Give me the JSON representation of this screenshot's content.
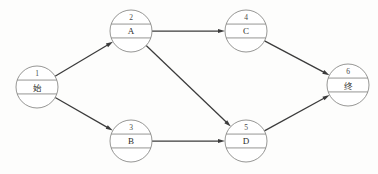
{
  "diagram": {
    "type": "directed-graph",
    "canvas": {
      "width": 378,
      "height": 174,
      "background": "#fdfdfc"
    },
    "style": {
      "node_stroke": "#8a8a88",
      "node_fill": "#ffffff",
      "edge_stroke": "#3b3b3b",
      "text_color": "#2e2e2c"
    },
    "nodes": [
      {
        "id": "1",
        "label": "始",
        "cjk": true,
        "cx": 37,
        "cy": 87,
        "r": 21
      },
      {
        "id": "2",
        "label": "A",
        "cjk": false,
        "cx": 131,
        "cy": 31,
        "r": 21
      },
      {
        "id": "3",
        "label": "B",
        "cjk": false,
        "cx": 131,
        "cy": 141,
        "r": 21
      },
      {
        "id": "4",
        "label": "C",
        "cjk": false,
        "cx": 246,
        "cy": 31,
        "r": 21
      },
      {
        "id": "5",
        "label": "D",
        "cjk": false,
        "cx": 246,
        "cy": 141,
        "r": 21
      },
      {
        "id": "6",
        "label": "终",
        "cjk": true,
        "cx": 348,
        "cy": 85,
        "r": 21
      }
    ],
    "edges": [
      {
        "from": "1",
        "to": "2",
        "directed": true
      },
      {
        "from": "1",
        "to": "3",
        "directed": true
      },
      {
        "from": "2",
        "to": "4",
        "directed": true
      },
      {
        "from": "2",
        "to": "5",
        "directed": true
      },
      {
        "from": "3",
        "to": "5",
        "directed": true
      },
      {
        "from": "4",
        "to": "6",
        "directed": true
      },
      {
        "from": "5",
        "to": "6",
        "directed": true
      }
    ]
  }
}
